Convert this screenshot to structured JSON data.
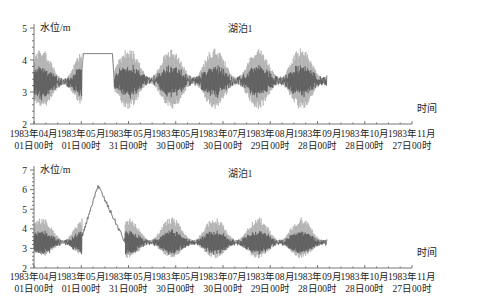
{
  "chart_data": [
    {
      "type": "line",
      "title": "湖泊1",
      "ylabel": "水位/m",
      "xlabel": "时间",
      "ylim": [
        2,
        5
      ],
      "yticks": [
        2,
        3,
        4,
        5
      ],
      "xlim": [
        "1983-04-01",
        "1983-11-27"
      ],
      "xtick_labels": [
        {
          "line1": "1983年04月",
          "line2": "01日00时"
        },
        {
          "line1": "1983年05月",
          "line2": "01日00时"
        },
        {
          "line1": "1983年05月",
          "line2": "31日00时"
        },
        {
          "line1": "1983年05月",
          "line2": "30日00时"
        },
        {
          "line1": "1983年07月",
          "line2": "30日00时"
        },
        {
          "line1": "1983年08月",
          "line2": "29日00时"
        },
        {
          "line1": "1983年09月",
          "line2": "28日00时"
        },
        {
          "line1": "1983年10月",
          "line2": "28日00时"
        },
        {
          "line1": "1983年11月",
          "line2": "27日00时"
        }
      ],
      "series": [
        {
          "name": "水位",
          "description": "high-frequency oscillating water level",
          "data_end": "1983-10-01",
          "segments": [
            {
              "from": "1983-04-01",
              "to": "1983-05-01",
              "mean": 3.3,
              "amplitude_min": 2.5,
              "amplitude_max": 4.35
            },
            {
              "from": "1983-05-02",
              "to": "1983-05-20",
              "plateau": 4.2
            },
            {
              "from": "1983-05-21",
              "to": "1983-10-01",
              "mean": 3.35,
              "amplitude_min": 2.45,
              "amplitude_max": 4.4
            }
          ]
        }
      ]
    },
    {
      "type": "line",
      "title": "湖泊1",
      "ylabel": "水位/m",
      "xlabel": "时间",
      "ylim": [
        2,
        7
      ],
      "yticks": [
        2,
        3,
        4,
        5,
        6,
        7
      ],
      "xlim": [
        "1983-04-01",
        "1983-11-27"
      ],
      "xtick_labels": [
        {
          "line1": "1983年04月",
          "line2": "01日00时"
        },
        {
          "line1": "1983年05月",
          "line2": "01日00时"
        },
        {
          "line1": "1983年05月",
          "line2": "31日00时"
        },
        {
          "line1": "1983年05月",
          "line2": "30日00时"
        },
        {
          "line1": "1983年07月",
          "line2": "30日00时"
        },
        {
          "line1": "1983年08月",
          "line2": "29日00时"
        },
        {
          "line1": "1983年09月",
          "line2": "28日00时"
        },
        {
          "line1": "1983年10月",
          "line2": "28日00时"
        },
        {
          "line1": "1983年11月",
          "line2": "27日00时"
        }
      ],
      "series": [
        {
          "name": "水位",
          "description": "oscillating water level with single peak",
          "data_end": "1983-10-01",
          "segments": [
            {
              "from": "1983-04-01",
              "to": "1983-05-01",
              "mean": 3.3,
              "amplitude_min": 2.6,
              "amplitude_max": 4.6
            },
            {
              "from": "1983-05-01",
              "to": "1983-05-11",
              "rise_to": 6.2
            },
            {
              "from": "1983-05-11",
              "to": "1983-05-28",
              "fall_to": 3.3
            },
            {
              "from": "1983-05-28",
              "to": "1983-10-01",
              "mean": 3.3,
              "amplitude_min": 2.5,
              "amplitude_max": 4.6
            }
          ],
          "peak": {
            "date": "1983-05-11",
            "value": 6.2
          }
        }
      ]
    }
  ]
}
